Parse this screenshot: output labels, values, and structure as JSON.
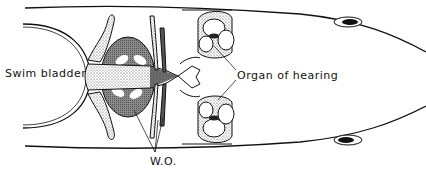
{
  "figure": {
    "type": "anatomical line drawing",
    "labels": {
      "swim_bladder": "Swim bladder",
      "organ_of_hearing": "Organ of hearing",
      "weberian_ossicles": "W.O."
    }
  }
}
